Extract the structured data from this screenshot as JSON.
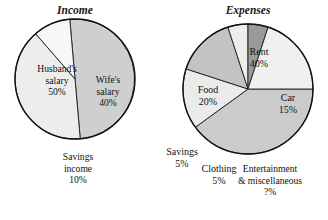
{
  "figure": {
    "background": "#ffffff",
    "outline_color": "#111111"
  },
  "chart_data": [
    {
      "type": "pie",
      "title": "Income",
      "name": "income-pie",
      "center": [
        75,
        79
      ],
      "radius": 60,
      "start_angle": 95,
      "direction": "clockwise",
      "categories": [
        "Husband's salary",
        "Wife's salary",
        "Savings income"
      ],
      "values": [
        50,
        40,
        10
      ],
      "value_labels": [
        "50%",
        "40%",
        "10%"
      ],
      "colors": [
        "#cfcfcf",
        "#ededed",
        "#f7f7f7"
      ],
      "labels": [
        {
          "name": "husband-salary",
          "lines": [
            "Husband's",
            "salary",
            "50%"
          ],
          "x": 57,
          "y": 72,
          "inside": true
        },
        {
          "name": "wife-salary",
          "lines": [
            "Wife's",
            "salary",
            "40%"
          ],
          "x": 108,
          "y": 83,
          "inside": true
        },
        {
          "name": "savings-income",
          "lines": [
            "Savings",
            "income",
            "10%"
          ],
          "x": 78,
          "y": 160,
          "inside": false
        }
      ]
    },
    {
      "type": "pie",
      "title": "Expenses",
      "name": "expenses-pie",
      "center": [
        248,
        89
      ],
      "radius": 65,
      "start_angle": 0,
      "direction": "clockwise",
      "categories": [
        "Rent",
        "Car",
        "Entertainment & miscellaneous",
        "Clothing",
        "Savings",
        "Food"
      ],
      "values": [
        40,
        15,
        15,
        5,
        5,
        20
      ],
      "value_labels": [
        "40%",
        "15%",
        "?%",
        "5%",
        "5%",
        "20%"
      ],
      "colors": [
        "#cbcbcb",
        "#ebebeb",
        "#c3c3c3",
        "#ededed",
        "#9a9a9a",
        "#f0f0f0"
      ],
      "labels": [
        {
          "name": "rent",
          "lines": [
            "Rent",
            "40%"
          ],
          "x": 259,
          "y": 55,
          "inside": true
        },
        {
          "name": "car",
          "lines": [
            "Car",
            "15%"
          ],
          "x": 288,
          "y": 101,
          "inside": true
        },
        {
          "name": "food",
          "lines": [
            "Food",
            "20%"
          ],
          "x": 208,
          "y": 93,
          "inside": true
        },
        {
          "name": "savings",
          "lines": [
            "Savings",
            "5%"
          ],
          "x": 182,
          "y": 155,
          "inside": false
        },
        {
          "name": "clothing",
          "lines": [
            "Clothing",
            "5%"
          ],
          "x": 219,
          "y": 172,
          "inside": false
        },
        {
          "name": "entertainment-misc",
          "lines": [
            "Entertainment",
            "& miscellaneous",
            "?%"
          ],
          "x": 270,
          "y": 172,
          "inside": false
        }
      ]
    }
  ]
}
